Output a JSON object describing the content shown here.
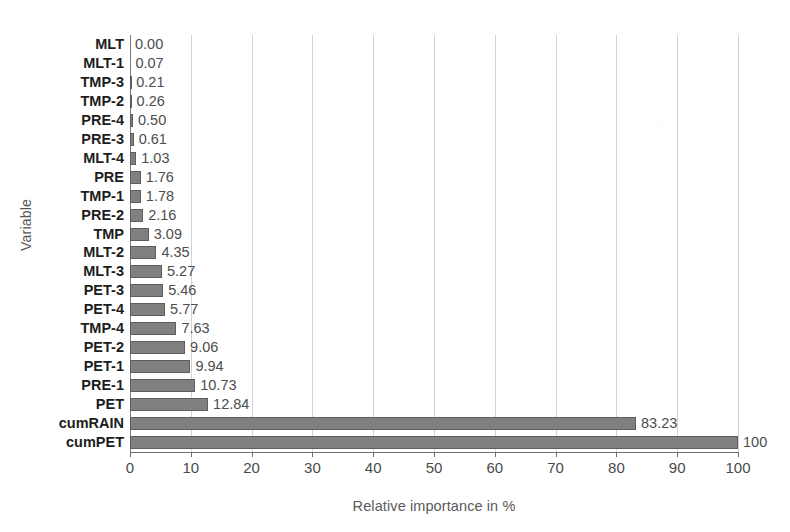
{
  "chart_data": {
    "type": "bar",
    "orientation": "horizontal",
    "title": "",
    "xlabel": "Relative importance in %",
    "ylabel": "Variable",
    "xlim": [
      0,
      100
    ],
    "xticks": [
      0,
      10,
      20,
      30,
      40,
      50,
      60,
      70,
      80,
      90,
      100
    ],
    "grid": "vertical",
    "legend": "none",
    "bar_color": "#808080",
    "bar_border_color": "#5e5e5e",
    "gridline_color": "#d2d2d2",
    "axis_color": "#6f6f6f",
    "categories": [
      "MLT",
      "MLT-1",
      "TMP-3",
      "TMP-2",
      "PRE-4",
      "PRE-3",
      "MLT-4",
      "PRE",
      "TMP-1",
      "PRE-2",
      "TMP",
      "MLT-2",
      "MLT-3",
      "PET-3",
      "PET-4",
      "TMP-4",
      "PET-2",
      "PET-1",
      "PRE-1",
      "PET",
      "cumRAIN",
      "cumPET"
    ],
    "values": [
      0.0,
      0.07,
      0.21,
      0.26,
      0.5,
      0.61,
      1.03,
      1.76,
      1.78,
      2.16,
      3.09,
      4.35,
      5.27,
      5.46,
      5.77,
      7.63,
      9.06,
      9.94,
      10.73,
      12.84,
      83.23,
      100.0
    ],
    "value_labels": [
      "0.00",
      "0.07",
      "0.21",
      "0.26",
      "0.50",
      "0.61",
      "1.03",
      "1.76",
      "1.78",
      "2.16",
      "3.09",
      "4.35",
      "5.27",
      "5.46",
      "5.77",
      "7.63",
      "9.06",
      "9.94",
      "10.73",
      "12.84",
      "83.23",
      "100"
    ]
  }
}
